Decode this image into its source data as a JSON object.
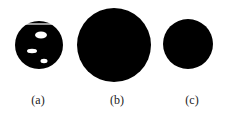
{
  "figure": {
    "panels": [
      {
        "label": "(a)",
        "circle": {
          "cx": 39,
          "cy": 45,
          "r": 24
        },
        "top_line": {
          "x1": 24,
          "x2": 54,
          "y": 24
        },
        "holes": [
          {
            "cx": 41,
            "cy": 35,
            "rx": 6,
            "ry": 3.5
          },
          {
            "cx": 32,
            "cy": 51,
            "rx": 5,
            "ry": 2.2
          },
          {
            "cx": 44,
            "cy": 61,
            "rx": 3.5,
            "ry": 2.2
          }
        ]
      },
      {
        "label": "(b)",
        "circle": {
          "cx": 114,
          "cy": 45,
          "r": 37
        }
      },
      {
        "label": "(c)",
        "circle": {
          "cx": 188,
          "cy": 44,
          "r": 25
        }
      }
    ],
    "colors": {
      "fill": "#000000",
      "background": "#ffffff"
    }
  }
}
